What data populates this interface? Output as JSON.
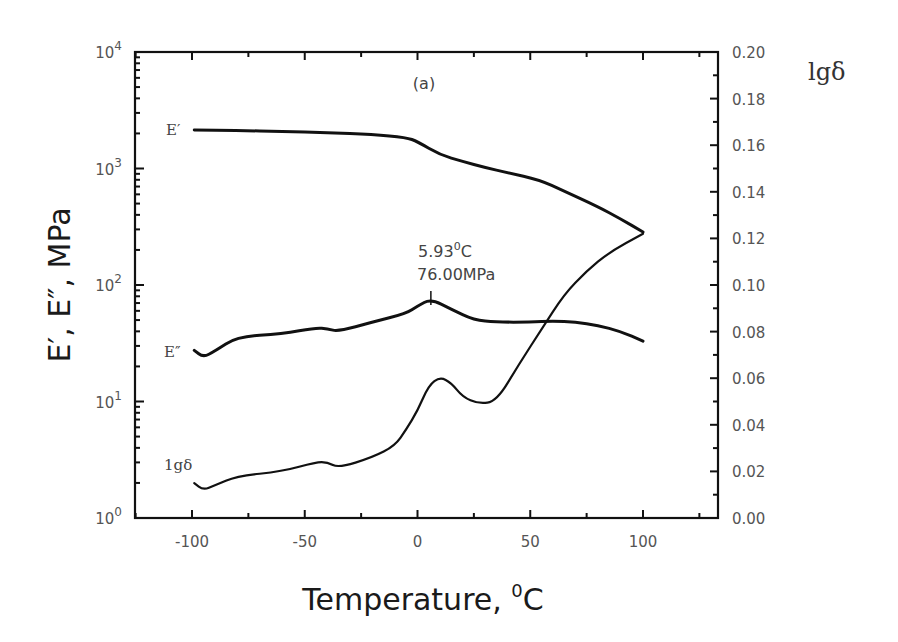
{
  "chart_data": {
    "type": "line",
    "panel_label": "(a)",
    "xlabel": "Temperature, ⁰C",
    "xlabel_main": "Temperature, ",
    "xlabel_sup": "0",
    "xlabel_unit": "C",
    "ylabel": "E′, E″, MPa",
    "ylabel_right": "lgδ",
    "xlim": [
      -125,
      133
    ],
    "xticks": [
      -100,
      -50,
      0,
      50,
      100
    ],
    "xtick_labels": [
      "-100",
      "-50",
      "0",
      "50",
      "100"
    ],
    "ylim_left_log": [
      1,
      10000
    ],
    "yticks_left": [
      {
        "base": "10",
        "exp": "0",
        "value": 1
      },
      {
        "base": "10",
        "exp": "1",
        "value": 10
      },
      {
        "base": "10",
        "exp": "2",
        "value": 100
      },
      {
        "base": "10",
        "exp": "3",
        "value": 1000
      },
      {
        "base": "10",
        "exp": "4",
        "value": 10000
      }
    ],
    "ylim_right": [
      0.0,
      0.2
    ],
    "yticks_right": [
      "0.00",
      "0.02",
      "0.04",
      "0.06",
      "0.08",
      "0.10",
      "0.12",
      "0.14",
      "0.16",
      "0.18",
      "0.20"
    ],
    "grid": false,
    "legend": "inline labels",
    "series": [
      {
        "name": "E′",
        "label": "E′",
        "axis": "left",
        "x": [
          -99,
          -80,
          -60,
          -40,
          -20,
          -5,
          0,
          10,
          20,
          30,
          40,
          54,
          65,
          80,
          90,
          100
        ],
        "y": [
          2140,
          2120,
          2080,
          2030,
          1960,
          1850,
          1700,
          1310,
          1150,
          1020,
          920,
          800,
          640,
          470,
          370,
          285
        ]
      },
      {
        "name": "E″",
        "label": "E″",
        "axis": "left",
        "x": [
          -99,
          -95,
          -90,
          -80,
          -60,
          -45,
          -40,
          -35,
          -20,
          -5,
          0,
          5.93,
          15,
          25,
          35,
          50,
          60,
          70,
          80,
          90,
          100
        ],
        "y": [
          27.5,
          24,
          27,
          36,
          38,
          43,
          42,
          40,
          48,
          57,
          66,
          76,
          62,
          50,
          48,
          48,
          49,
          48,
          45,
          40,
          33
        ]
      },
      {
        "name": "lgδ",
        "label": "1gδ",
        "axis": "right",
        "x": [
          -99,
          -95,
          -90,
          -80,
          -60,
          -45,
          -40,
          -35,
          -20,
          -10,
          -5,
          0,
          5,
          10,
          15,
          20,
          27,
          35,
          45,
          55,
          65,
          75,
          85,
          100
        ],
        "y": [
          0.015,
          0.012,
          0.014,
          0.018,
          0.02,
          0.024,
          0.024,
          0.0215,
          0.026,
          0.031,
          0.038,
          0.046,
          0.057,
          0.0605,
          0.058,
          0.052,
          0.049,
          0.05,
          0.066,
          0.081,
          0.096,
          0.106,
          0.114,
          0.122
        ]
      }
    ],
    "annotations": [
      {
        "text_line1_main": "5.93",
        "text_line1_sup": "0",
        "text_line1_unit": "C",
        "text_line2": "76.00MPa",
        "x": 5.93,
        "y": 76
      }
    ]
  }
}
